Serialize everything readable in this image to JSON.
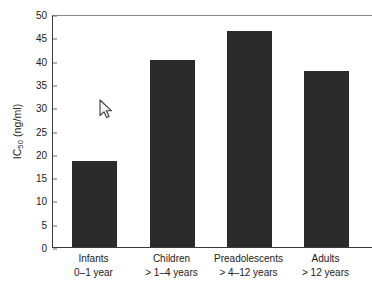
{
  "chart_data": {
    "type": "bar",
    "title": "",
    "xlabel": "",
    "ylabel": "IC50 (ng/ml)",
    "ylabel_base": "IC",
    "ylabel_sub": "50",
    "ylabel_unit": " (ng/ml)",
    "ylim": [
      0,
      50
    ],
    "ytick_step": 5,
    "yticks": [
      "0",
      "5",
      "10",
      "15",
      "20",
      "25",
      "30",
      "35",
      "40",
      "45",
      "50"
    ],
    "ytick_values": [
      0,
      5,
      10,
      15,
      20,
      25,
      30,
      35,
      40,
      45,
      50
    ],
    "grid": false,
    "legend": "none",
    "bar_color": "#2b2b2b",
    "axis_color": "#3a3a3a",
    "categories": [
      "Infants",
      "Children",
      "Preadolescents",
      "Adults"
    ],
    "category_sublabels": [
      "0–1 year",
      "> 1–4 years",
      "> 4–12 years",
      "> 12 years"
    ],
    "values": [
      18.5,
      40.1,
      46.4,
      37.8
    ]
  },
  "cursor": {
    "icon": "mouse-pointer-icon",
    "x": 102,
    "y": 103
  }
}
